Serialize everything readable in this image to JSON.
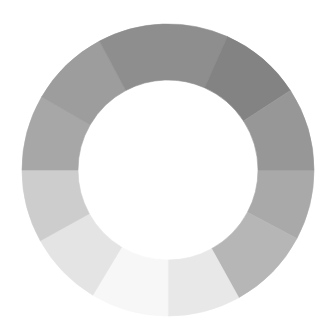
{
  "diagram": {
    "type": "segmented-ring",
    "segment_count": 11,
    "segments": [
      {
        "start_deg": 0,
        "end_deg": 28,
        "color": "#a9a9a9"
      },
      {
        "start_deg": 28,
        "end_deg": 61,
        "color": "#b6b6b6"
      },
      {
        "start_deg": 61,
        "end_deg": 90,
        "color": "#e8e8e8"
      },
      {
        "start_deg": 90,
        "end_deg": 121,
        "color": "#f7f7f7"
      },
      {
        "start_deg": 121,
        "end_deg": 151,
        "color": "#e4e4e4"
      },
      {
        "start_deg": 151,
        "end_deg": 180,
        "color": "#cdcdcd"
      },
      {
        "start_deg": 180,
        "end_deg": 210,
        "color": "#a7a7a7"
      },
      {
        "start_deg": 210,
        "end_deg": 242,
        "color": "#9d9d9d"
      },
      {
        "start_deg": 242,
        "end_deg": 294,
        "color": "#8e8e8e"
      },
      {
        "start_deg": 294,
        "end_deg": 327,
        "color": "#838383"
      },
      {
        "start_deg": 327,
        "end_deg": 360,
        "color": "#979797"
      }
    ]
  }
}
